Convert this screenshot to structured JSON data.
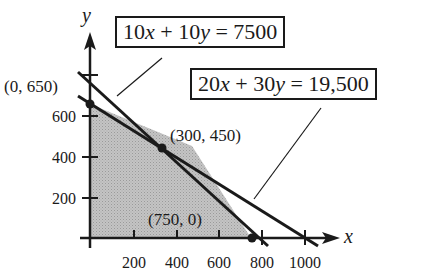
{
  "diagram": {
    "type": "linear-programming-feasible-region",
    "axes": {
      "x_label": "x",
      "y_label": "y",
      "x_ticks": [
        "200",
        "400",
        "600",
        "800",
        "1000"
      ],
      "y_ticks": [
        "200",
        "400",
        "600"
      ]
    },
    "constraints": [
      {
        "id": "line1",
        "label": "10x + 10y = 7500",
        "parts": [
          "10",
          "x",
          " + 10",
          "y",
          " = 7500"
        ]
      },
      {
        "id": "line2",
        "label": "20x + 30y = 19,500",
        "parts": [
          "20",
          "x",
          " + 30",
          "y",
          " = 19,500"
        ]
      }
    ],
    "vertices": [
      {
        "label": "(0, 650)",
        "x": 0,
        "y": 650
      },
      {
        "label": "(300, 450)",
        "x": 300,
        "y": 450
      },
      {
        "label": "(750, 0)",
        "x": 750,
        "y": 0
      }
    ],
    "colors": {
      "ink": "#1a1a1a",
      "region_fill": "#b8b8b8",
      "background": "#ffffff"
    }
  }
}
